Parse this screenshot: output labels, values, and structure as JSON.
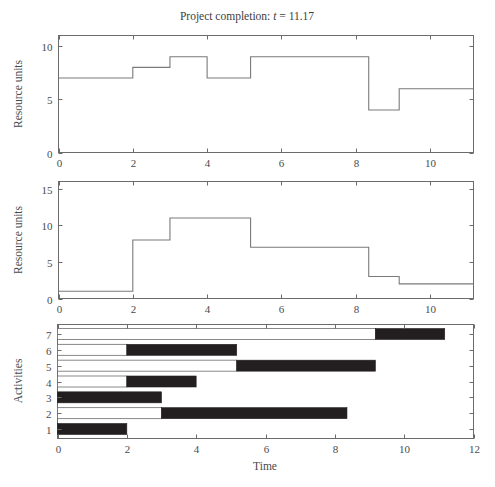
{
  "figure": {
    "title_prefix": "Project completion: ",
    "title_var": "t",
    "title_value": " = 11.17",
    "width": 495,
    "height": 487,
    "background": "#ffffff",
    "line_color": "#7a7a7a",
    "bar_done_color": "#231f20",
    "bar_open_color": "#ffffff",
    "axis_color": "#6b6b6b"
  },
  "chart_data": [
    {
      "id": "resource-profile-1",
      "type": "line",
      "style": "step-post",
      "title": "Project completion: t = 11.17",
      "xlabel": "",
      "ylabel": "Resource units",
      "xlim": [
        0,
        11.17
      ],
      "ylim": [
        0,
        11
      ],
      "xticks": [
        0,
        2,
        4,
        6,
        8,
        10
      ],
      "xticklabels": [
        "0",
        "2",
        "4",
        "6",
        "8",
        "10"
      ],
      "yticks": [
        0,
        5,
        10
      ],
      "yticklabels": [
        "0",
        "5",
        "10"
      ],
      "grid": false,
      "legend": "none",
      "x": [
        0,
        2,
        3,
        4,
        5.17,
        8.35,
        9.17,
        11.17
      ],
      "y": [
        7,
        8,
        9,
        7,
        9,
        4,
        6,
        6
      ],
      "steps": [
        {
          "from": 0,
          "to": 2,
          "value": 7
        },
        {
          "from": 2,
          "to": 3,
          "value": 8
        },
        {
          "from": 3,
          "to": 4,
          "value": 9
        },
        {
          "from": 4,
          "to": 5.17,
          "value": 7
        },
        {
          "from": 5.17,
          "to": 8.35,
          "value": 9
        },
        {
          "from": 8.35,
          "to": 9.17,
          "value": 4
        },
        {
          "from": 9.17,
          "to": 11.17,
          "value": 6
        }
      ]
    },
    {
      "id": "resource-profile-2",
      "type": "line",
      "style": "step-post",
      "title": "",
      "xlabel": "",
      "ylabel": "Resource units",
      "xlim": [
        0,
        11.17
      ],
      "ylim": [
        0,
        16
      ],
      "xticks": [
        0,
        2,
        4,
        6,
        8,
        10
      ],
      "xticklabels": [
        "0",
        "2",
        "4",
        "6",
        "8",
        "10"
      ],
      "yticks": [
        0,
        5,
        10,
        15
      ],
      "yticklabels": [
        "0",
        "5",
        "10",
        "15"
      ],
      "grid": false,
      "legend": "none",
      "x": [
        0,
        2,
        3,
        5.17,
        8.35,
        9.17,
        11.17
      ],
      "y": [
        1,
        8,
        11,
        7,
        3,
        2,
        2
      ],
      "steps": [
        {
          "from": 0,
          "to": 2,
          "value": 1
        },
        {
          "from": 2,
          "to": 3,
          "value": 8
        },
        {
          "from": 3,
          "to": 5.17,
          "value": 11
        },
        {
          "from": 5.17,
          "to": 8.35,
          "value": 7
        },
        {
          "from": 8.35,
          "to": 9.17,
          "value": 3
        },
        {
          "from": 9.17,
          "to": 11.17,
          "value": 2
        }
      ]
    },
    {
      "id": "gantt-activities",
      "type": "bar",
      "orientation": "horizontal",
      "title": "",
      "xlabel": "Time",
      "ylabel": "Activities",
      "xlim": [
        0,
        12
      ],
      "ylim": [
        0.4,
        7.6
      ],
      "xticks": [
        0,
        2,
        4,
        6,
        8,
        10,
        12
      ],
      "xticklabels": [
        "0",
        "2",
        "4",
        "6",
        "8",
        "10",
        "12"
      ],
      "yticks": [
        1,
        2,
        3,
        4,
        5,
        6,
        7
      ],
      "yticklabels": [
        "1",
        "2",
        "3",
        "4",
        "5",
        "6",
        "7"
      ],
      "grid": false,
      "legend": "none",
      "categories": [
        "1",
        "2",
        "3",
        "4",
        "5",
        "6",
        "7"
      ],
      "bars": [
        {
          "activity": "1",
          "open_start": 0,
          "open_end": 0,
          "done_start": 0,
          "done_end": 2
        },
        {
          "activity": "2",
          "open_start": 0,
          "open_end": 3,
          "done_start": 3,
          "done_end": 8.35
        },
        {
          "activity": "3",
          "open_start": 0,
          "open_end": 0,
          "done_start": 0,
          "done_end": 3
        },
        {
          "activity": "4",
          "open_start": 0,
          "open_end": 2,
          "done_start": 2,
          "done_end": 4
        },
        {
          "activity": "5",
          "open_start": 0,
          "open_end": 5.17,
          "done_start": 5.17,
          "done_end": 9.17
        },
        {
          "activity": "6",
          "open_start": 0,
          "open_end": 2,
          "done_start": 2,
          "done_end": 5.17
        },
        {
          "activity": "7",
          "open_start": 0,
          "open_end": 9.17,
          "done_start": 9.17,
          "done_end": 11.17
        }
      ]
    }
  ]
}
